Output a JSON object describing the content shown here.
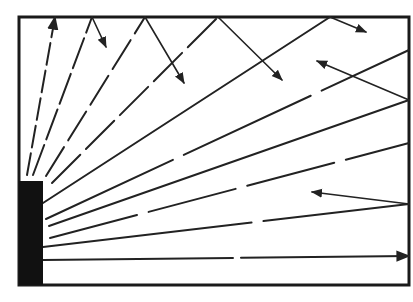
{
  "diagram": {
    "type": "ray-reflection-room",
    "colors": {
      "line": "#222222",
      "source": "#111111",
      "background": "#ffffff"
    },
    "room": {
      "x1": 19,
      "y1": 17,
      "x2": 409,
      "y2": 285
    },
    "source_block": {
      "x": 19,
      "y": 181,
      "w": 24,
      "h": 104
    },
    "rays": [
      {
        "id": "r1",
        "from": [
          27,
          175
        ],
        "to": [
          55,
          17
        ],
        "dash": "22 6",
        "arrow_end": true
      },
      {
        "id": "r2",
        "from": [
          33,
          175
        ],
        "to": [
          92,
          17
        ],
        "dash": "32 6"
      },
      {
        "id": "r3",
        "from": [
          46,
          176
        ],
        "to": [
          145,
          17
        ],
        "dash": "34 8"
      },
      {
        "id": "r4",
        "from": [
          52,
          183
        ],
        "to": [
          218,
          17
        ],
        "dash": "40 8"
      },
      {
        "id": "r5",
        "from": [
          43,
          203
        ],
        "to": [
          330,
          17
        ],
        "dash": "none"
      },
      {
        "id": "r6",
        "from": [
          46,
          219
        ],
        "to": [
          409,
          50
        ],
        "dash": "140 12"
      },
      {
        "id": "r7",
        "from": [
          49,
          226
        ],
        "to": [
          409,
          100
        ],
        "dash": "none"
      },
      {
        "id": "r8",
        "from": [
          50,
          238
        ],
        "to": [
          409,
          143
        ],
        "dash": "90 12"
      },
      {
        "id": "r9",
        "from": [
          43,
          247
        ],
        "to": [
          409,
          204
        ],
        "dash": "210 12"
      },
      {
        "id": "r10",
        "from": [
          43,
          260
        ],
        "to": [
          409,
          256
        ],
        "dash": "190 8",
        "arrow_end": true
      }
    ],
    "reflections": [
      {
        "id": "f1",
        "from": [
          92,
          17
        ],
        "to": [
          106,
          47
        ],
        "arrow_end": true
      },
      {
        "id": "f2",
        "from": [
          145,
          17
        ],
        "to": [
          184,
          83
        ],
        "arrow_end": true
      },
      {
        "id": "f3",
        "from": [
          218,
          17
        ],
        "to": [
          282,
          80
        ],
        "arrow_end": true
      },
      {
        "id": "f4",
        "from": [
          330,
          17
        ],
        "to": [
          366,
          32
        ],
        "arrow_end": true
      },
      {
        "id": "f5",
        "from": [
          409,
          100
        ],
        "to": [
          317,
          61
        ],
        "arrow_end": true
      },
      {
        "id": "f6",
        "from": [
          409,
          204
        ],
        "to": [
          312,
          192
        ],
        "arrow_end": true
      }
    ]
  }
}
